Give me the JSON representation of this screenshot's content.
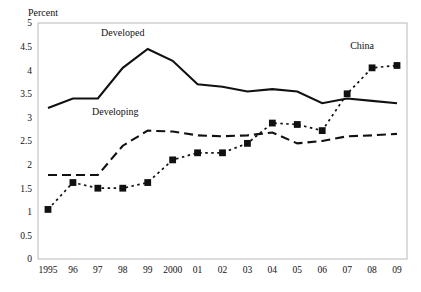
{
  "chart_data": {
    "type": "line",
    "title": "",
    "xlabel": "",
    "ylabel": "Percent",
    "ylim": [
      0,
      5
    ],
    "ytick_step": 0.5,
    "yticks": [
      "0",
      "0.5",
      "1",
      "1.5",
      "2",
      "2.5",
      "3",
      "3.5",
      "4",
      "4.5",
      "5"
    ],
    "grid": false,
    "legend": "inline-labels",
    "x": [
      1995,
      1996,
      1997,
      1998,
      1999,
      2000,
      2001,
      2002,
      2003,
      2004,
      2005,
      2006,
      2007,
      2008,
      2009
    ],
    "categories": [
      "1995",
      "96",
      "97",
      "98",
      "99",
      "2000",
      "01",
      "02",
      "03",
      "04",
      "05",
      "06",
      "07",
      "08",
      "09"
    ],
    "series": [
      {
        "name": "Developed",
        "style": "solid",
        "marker": "none",
        "color": "#111111",
        "label_x": 1998,
        "label_y": 4.72,
        "values": [
          3.2,
          3.4,
          3.4,
          4.05,
          4.45,
          4.2,
          3.7,
          3.65,
          3.55,
          3.6,
          3.55,
          3.3,
          3.4,
          3.35,
          3.3
        ]
      },
      {
        "name": "Developing",
        "style": "dashed",
        "marker": "none",
        "color": "#111111",
        "label_x": 1997.7,
        "label_y": 3.05,
        "values": [
          1.78,
          1.78,
          1.78,
          2.4,
          2.72,
          2.7,
          2.62,
          2.6,
          2.62,
          2.68,
          2.45,
          2.5,
          2.6,
          2.62,
          2.65
        ]
      },
      {
        "name": "China",
        "style": "dotted",
        "marker": "square",
        "color": "#111111",
        "label_x": 2007.6,
        "label_y": 4.45,
        "values": [
          1.05,
          1.62,
          1.5,
          1.5,
          1.62,
          2.1,
          2.25,
          2.25,
          2.45,
          2.88,
          2.85,
          2.72,
          3.5,
          4.05,
          4.1
        ]
      }
    ]
  }
}
